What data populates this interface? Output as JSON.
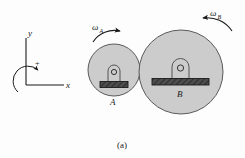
{
  "figure": {
    "caption": "(a)",
    "background_color": "#fdfdfd",
    "line_color": "#1a1a1a"
  },
  "axes": {
    "name": "coordinate-frame",
    "y_label": "y",
    "x_label": "x",
    "sign_label": "+",
    "sense": "counterclockwise-positive"
  },
  "gears": [
    {
      "id": "A",
      "label": "A",
      "label_position": "below",
      "center_x": 114,
      "center_y": 70,
      "radius": 26,
      "fill_color": "#cccccc",
      "stroke_color": "#4a4a4a",
      "omega_label": "ω",
      "omega_subscript": "A",
      "rotation_sense": "clockwise"
    },
    {
      "id": "B",
      "label": "B",
      "label_position": "below-bar",
      "center_x": 181,
      "center_y": 72,
      "radius": 42,
      "fill_color": "#cccccc",
      "stroke_color": "#4a4a4a",
      "omega_label": "ω",
      "omega_subscript": "B",
      "rotation_sense": "counterclockwise"
    }
  ],
  "supports": [
    {
      "for_gear": "A",
      "bearing_shape": "arch-with-pin-hole",
      "ground_bar_color": "#4d4d4d",
      "hatch_color": "#2b2b2b"
    },
    {
      "for_gear": "B",
      "bearing_shape": "arch-with-pin-hole",
      "ground_bar_color": "#4d4d4d",
      "hatch_color": "#2b2b2b"
    }
  ]
}
